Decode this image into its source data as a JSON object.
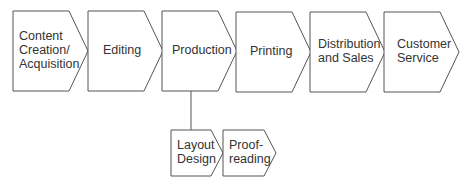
{
  "diagram": {
    "main_flow": [
      {
        "id": "content",
        "lines": [
          "Content",
          "Creation/",
          "Acquisition"
        ],
        "x": 13,
        "y": 11
      },
      {
        "id": "editing",
        "lines": [
          "Editing"
        ],
        "x": 88,
        "y": 11
      },
      {
        "id": "production",
        "lines": [
          "Production"
        ],
        "x": 162,
        "y": 11
      },
      {
        "id": "printing",
        "lines": [
          "Printing"
        ],
        "x": 236,
        "y": 12
      },
      {
        "id": "distribution",
        "lines": [
          "Distribution",
          "and Sales"
        ],
        "x": 310,
        "y": 12
      },
      {
        "id": "customer",
        "lines": [
          "Customer",
          "Service"
        ],
        "x": 384,
        "y": 12
      }
    ],
    "sub_flow": [
      {
        "id": "layout",
        "lines": [
          "Layout",
          "Design"
        ],
        "x": 171,
        "y": 130
      },
      {
        "id": "proofreading",
        "lines": [
          "Proof-",
          "reading"
        ],
        "x": 223,
        "y": 130
      }
    ],
    "connector": {
      "from": "production",
      "to": "layout"
    },
    "colors": {
      "stroke": "#555555",
      "text": "#333333",
      "fill": "#ffffff"
    }
  }
}
